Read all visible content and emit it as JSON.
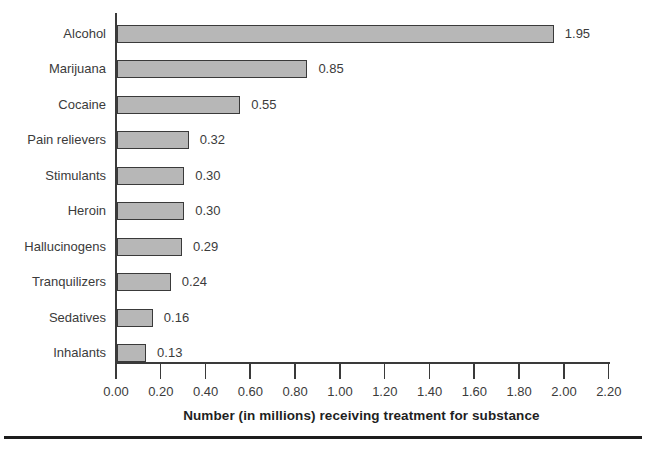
{
  "chart_data": {
    "type": "bar",
    "orientation": "horizontal",
    "title": "",
    "xlabel": "Number (in millions) receiving treatment for substance",
    "ylabel": "",
    "categories": [
      "Alcohol",
      "Marijuana",
      "Cocaine",
      "Pain relievers",
      "Stimulants",
      "Heroin",
      "Hallucinogens",
      "Tranquilizers",
      "Sedatives",
      "Inhalants"
    ],
    "values": [
      1.95,
      0.85,
      0.55,
      0.32,
      0.3,
      0.3,
      0.29,
      0.24,
      0.16,
      0.13
    ],
    "value_labels": [
      "1.95",
      "0.85",
      "0.55",
      "0.32",
      "0.30",
      "0.30",
      "0.29",
      "0.24",
      "0.16",
      "0.13"
    ],
    "x_ticks": [
      "0.00",
      "0.20",
      "0.40",
      "0.60",
      "0.80",
      "1.00",
      "1.20",
      "1.40",
      "1.60",
      "1.80",
      "2.00",
      "2.20"
    ],
    "xlim": [
      0.0,
      2.2
    ],
    "grid": "off",
    "legend": "none",
    "colors": {
      "bar_fill": "#b7b7b7",
      "bar_border": "#3a3a3a",
      "axis": "#3a3a3a",
      "text": "#3b3b3b",
      "axis_title": "#1f1f1f",
      "bottom_rule": "#1c1c1c",
      "background": "#ffffff"
    }
  }
}
